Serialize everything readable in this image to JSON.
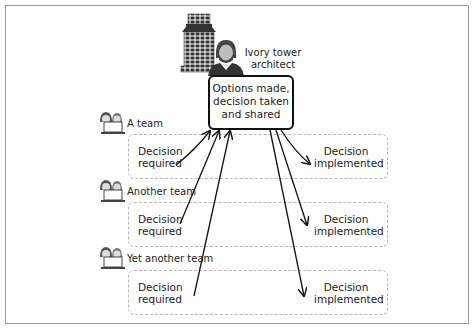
{
  "architect": {
    "label_line1": "Ivory tower",
    "label_line2": "architect"
  },
  "central_box": {
    "line1": "Options made,",
    "line2": "decision taken",
    "line3": "and shared"
  },
  "teams": [
    {
      "name": "A team",
      "required_line1": "Decision",
      "required_line2": "required",
      "implemented_line1": "Decision",
      "implemented_line2": "implemented"
    },
    {
      "name": "Another team",
      "required_line1": "Decision",
      "required_line2": "required",
      "implemented_line1": "Decision",
      "implemented_line2": "implemented"
    },
    {
      "name": "Yet another team",
      "required_line1": "Decision",
      "required_line2": "required",
      "implemented_line1": "Decision",
      "implemented_line2": "implemented"
    }
  ],
  "colors": {
    "stroke": "#111111",
    "dashed_border": "#b5b5b5",
    "frame": "#9a9a9a"
  }
}
